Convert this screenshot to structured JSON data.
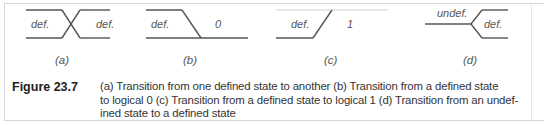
{
  "figure": {
    "number": "Figure 23.7",
    "caption_lines": [
      "(a) Transition from one defined state to another (b) Transition from a defined state",
      "to logical 0 (c) Transition from a defined state to logical 1 (d) Transition from an undef-",
      "ined state to a defined state"
    ]
  },
  "panels": [
    {
      "id": "a",
      "sublabel": "(a)",
      "left_text": "def.",
      "right_text": "def."
    },
    {
      "id": "b",
      "sublabel": "(b)",
      "left_text": "def.",
      "right_text": "0"
    },
    {
      "id": "c",
      "sublabel": "(c)",
      "left_text": "def.",
      "right_text": "1"
    },
    {
      "id": "d",
      "sublabel": "(d)",
      "left_text": "undef.",
      "right_text": "def."
    }
  ],
  "colors": {
    "line": "#555555",
    "line_light": "#c8c8c8",
    "text": "#333333",
    "border": "#d6d6d6"
  }
}
